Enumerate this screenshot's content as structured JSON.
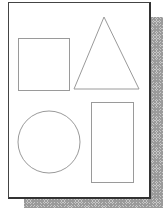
{
  "figure": {
    "stroke_color": "#9a9a9a",
    "page_border_color": "#444444",
    "shadow_color": "#b0b0b0",
    "shapes": [
      {
        "name": "square",
        "x": 18,
        "y": 38,
        "width": 51,
        "height": 52
      },
      {
        "name": "triangle",
        "points": "104,17 74,89 139,89"
      },
      {
        "name": "circle",
        "cx": 49,
        "cy": 142,
        "r": 31
      },
      {
        "name": "rectangle",
        "x": 91,
        "y": 102,
        "width": 42,
        "height": 80
      }
    ]
  }
}
